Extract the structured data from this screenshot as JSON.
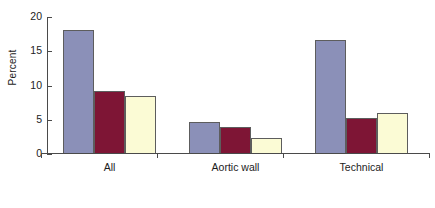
{
  "chart_data": {
    "type": "bar",
    "title": "",
    "subtitle": "",
    "xlabel": "",
    "ylabel": "Percent",
    "categories": [
      "All",
      "Aortic wall",
      "Technical"
    ],
    "ylim": [
      0,
      20
    ],
    "yticks": [
      0,
      5,
      10,
      15,
      20
    ],
    "ytick_labels": [
      "0",
      "5",
      "10",
      "15",
      "20"
    ],
    "grid": false,
    "legend": "none",
    "series": [
      {
        "name": "series-1",
        "color": "#8b90b8",
        "values": [
          18.1,
          4.7,
          16.7
        ]
      },
      {
        "name": "series-2",
        "color": "#7e1535",
        "values": [
          9.2,
          4.0,
          5.3
        ]
      },
      {
        "name": "series-3",
        "color": "#fbfbd5",
        "values": [
          8.4,
          2.3,
          6.0
        ]
      }
    ]
  },
  "colors": {
    "series_1": "#8b90b8",
    "series_2": "#7e1535",
    "series_3": "#fbfbd5",
    "axis": "#4a4a4a",
    "bar_outline": "#5d5d5d",
    "text": "#1c1c1c",
    "background": "#ffffff"
  }
}
